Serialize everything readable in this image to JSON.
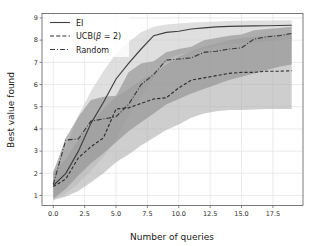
{
  "chart_data": {
    "type": "line",
    "title": "",
    "xlabel": "Number of queries",
    "ylabel": "Best value found",
    "xlim": [
      -0.9,
      19.9
    ],
    "ylim": [
      0.55,
      9.2
    ],
    "xticks": [
      "0.0",
      "2.5",
      "5.0",
      "7.5",
      "10.0",
      "12.5",
      "15.0",
      "17.5"
    ],
    "xtick_values": [
      0,
      2.5,
      5,
      7.5,
      10,
      12.5,
      15,
      17.5
    ],
    "yticks": [
      "1",
      "2",
      "3",
      "4",
      "5",
      "6",
      "7",
      "8",
      "9"
    ],
    "ytick_values": [
      1,
      2,
      3,
      4,
      5,
      6,
      7,
      8,
      9
    ],
    "grid": true,
    "legend_position": "upper left",
    "x": [
      0,
      1,
      2,
      3,
      4,
      5,
      6,
      7,
      8,
      9,
      10,
      11,
      12,
      13,
      14,
      15,
      16,
      17,
      18,
      19
    ],
    "series": [
      {
        "name": "EI",
        "style": "solid",
        "color": "#3f3f3f",
        "values": [
          1.45,
          2.0,
          3.0,
          4.25,
          5.2,
          6.25,
          6.95,
          7.6,
          8.2,
          8.35,
          8.4,
          8.5,
          8.55,
          8.6,
          8.62,
          8.63,
          8.64,
          8.65,
          8.66,
          8.67
        ],
        "band_lower": [
          0.8,
          1.1,
          1.55,
          2.1,
          2.75,
          3.5,
          4.6,
          5.5,
          6.3,
          7.1,
          7.35,
          7.45,
          7.6,
          7.75,
          7.8,
          7.85,
          7.9,
          7.95,
          8.0,
          8.05
        ],
        "band_upper": [
          2.1,
          3.2,
          4.6,
          5.7,
          6.6,
          7.4,
          7.9,
          8.35,
          8.6,
          8.7,
          8.75,
          8.8,
          8.82,
          8.84,
          8.86,
          8.87,
          8.88,
          8.89,
          8.9,
          8.9
        ]
      },
      {
        "name": "UCB(β = 2)",
        "style": "dashed",
        "color": "#2e2e2e",
        "values": [
          1.4,
          1.75,
          2.7,
          3.2,
          3.6,
          4.9,
          4.95,
          5.15,
          5.35,
          5.4,
          5.85,
          6.2,
          6.3,
          6.4,
          6.5,
          6.55,
          6.55,
          6.6,
          6.6,
          6.62
        ],
        "band_lower": [
          0.8,
          0.95,
          1.2,
          1.6,
          2.0,
          2.5,
          2.85,
          3.25,
          3.6,
          3.95,
          4.2,
          4.5,
          4.7,
          4.8,
          4.85,
          4.85,
          4.88,
          4.9,
          4.9,
          4.9
        ],
        "band_upper": [
          2.0,
          2.65,
          3.5,
          4.2,
          4.9,
          5.45,
          5.8,
          6.2,
          6.5,
          6.9,
          7.25,
          7.5,
          7.7,
          7.85,
          8.0,
          8.1,
          8.15,
          8.2,
          8.25,
          8.3
        ]
      },
      {
        "name": "Random",
        "style": "dashdot",
        "color": "#3a3a3a",
        "values": [
          1.5,
          3.5,
          3.55,
          4.35,
          4.45,
          4.55,
          5.1,
          6.0,
          6.45,
          7.1,
          7.15,
          7.2,
          7.45,
          7.5,
          7.6,
          7.65,
          8.05,
          8.15,
          8.2,
          8.3
        ],
        "band_lower": [
          0.85,
          1.3,
          1.9,
          2.45,
          2.9,
          3.4,
          3.9,
          4.3,
          4.7,
          5.1,
          5.35,
          5.6,
          5.8,
          6.0,
          6.2,
          6.35,
          6.5,
          6.65,
          6.8,
          6.9
        ],
        "band_upper": [
          2.05,
          3.6,
          4.55,
          5.3,
          5.45,
          5.5,
          6.55,
          6.95,
          7.05,
          7.45,
          7.6,
          7.7,
          8.0,
          8.1,
          8.2,
          8.25,
          8.45,
          8.5,
          8.55,
          8.6
        ]
      }
    ],
    "legend": [
      "EI",
      "UCB(β = 2)",
      "Random"
    ],
    "band_description": "shaded interquartile / confidence bands around each mean curve",
    "colors": {
      "band_light": "#cccccc",
      "band_mid": "#b0b0b0",
      "band_dark": "#8e8e8e",
      "grid": "#e2e2e2",
      "axis": "#555555",
      "background": "#ffffff"
    }
  },
  "legend": {
    "ei_label": "EI",
    "ucb_label_prefix": "UCB(",
    "ucb_beta": "β",
    "ucb_eq": " = 2)",
    "random_label": "Random"
  },
  "axes": {
    "xlabel": "Number of queries",
    "ylabel": "Best value found"
  }
}
